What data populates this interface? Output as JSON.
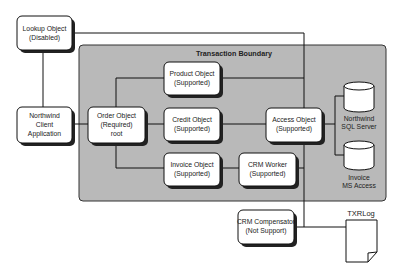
{
  "boundary": {
    "title": "Transaction Boundary",
    "fill": "#b8b8b8"
  },
  "nodes": {
    "lookup": {
      "line1": "Lookup Object",
      "line2": "(Disabled)"
    },
    "client": {
      "line1": "Northwind",
      "line2": "Client",
      "line3": "Application"
    },
    "order": {
      "line1": "Order Object",
      "line2": "(Required)",
      "line3": "root"
    },
    "product": {
      "line1": "Product Object",
      "line2": "(Supported)"
    },
    "credit": {
      "line1": "Credit Object",
      "line2": "(Supported)"
    },
    "invoice": {
      "line1": "Invoice Object",
      "line2": "(Supported)"
    },
    "crm_worker": {
      "line1": "CRM Worker",
      "line2": "(Supported)"
    },
    "access": {
      "line1": "Access Object",
      "line2": "(Supported)"
    },
    "crm_comp": {
      "line1": "CRM Compensator",
      "line2": "(Not Support)"
    }
  },
  "databases": {
    "sql": {
      "line1": "Northwind",
      "line2": "SQL Server"
    },
    "msaccess": {
      "line1": "Invoice",
      "line2": "MS Access"
    }
  },
  "log": {
    "label": "TXRLog"
  }
}
